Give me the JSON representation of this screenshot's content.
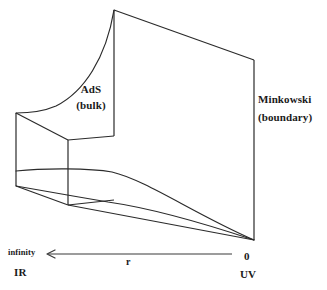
{
  "figure": {
    "stroke_color": "#2b2b2b",
    "background_color": "#ffffff",
    "labels": {
      "ads": "AdS",
      "ads_sub": "(bulk)",
      "minkowski": "Minkowski",
      "minkowski_sub": "(boundary)",
      "infinity": "infinity",
      "ir": "IR",
      "radial": "r",
      "zero": "0",
      "uv": "UV"
    },
    "axis": {
      "arrow_direction": "left",
      "left_end_label": "infinity",
      "left_end_secondary": "IR",
      "right_end_label": "0",
      "right_end_secondary": "UV",
      "variable": "r"
    }
  }
}
